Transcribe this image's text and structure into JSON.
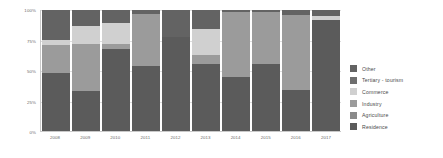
{
  "chart_data": {
    "type": "bar",
    "stacked": true,
    "stack_mode": "percent",
    "title": "",
    "subtitle": "",
    "xlabel": "",
    "ylabel": "",
    "ylim": [
      0,
      100
    ],
    "ytick_labels": [
      "0%",
      "25%",
      "50%",
      "75%",
      "100%"
    ],
    "ytick_values": [
      0,
      25,
      50,
      75,
      100
    ],
    "grid": true,
    "legend_position": "right",
    "categories": [
      "2008",
      "2009",
      "2010",
      "2011",
      "2012",
      "2013",
      "2014",
      "2015",
      "2016",
      "2017"
    ],
    "series": [
      {
        "name": "Residence",
        "color": "#5b5b5b",
        "values": [
          48,
          33,
          68,
          54,
          78,
          55,
          45,
          55,
          34,
          92
        ]
      },
      {
        "name": "Agriculture",
        "color": "#7f7f7f",
        "values": [
          0,
          0,
          0,
          0,
          0,
          0,
          0,
          0,
          0,
          0
        ]
      },
      {
        "name": "Industry",
        "color": "#9b9b9b",
        "values": [
          23,
          39,
          4,
          43,
          0,
          8,
          53,
          43,
          62,
          0
        ]
      },
      {
        "name": "Commerce",
        "color": "#d0d0d0",
        "values": [
          4,
          15,
          17,
          0,
          0,
          21,
          0,
          0,
          0,
          3
        ]
      },
      {
        "name": "Tertiary - tourism",
        "color": "#6e6e6e",
        "values": [
          0,
          0,
          0,
          0,
          0,
          0,
          0,
          0,
          0,
          0
        ]
      },
      {
        "name": "Other",
        "color": "#636363",
        "values": [
          25,
          13,
          11,
          3,
          22,
          16,
          2,
          2,
          4,
          5
        ]
      }
    ],
    "legend_entries": [
      {
        "label": "Other",
        "color": "#636363"
      },
      {
        "label": "Tertiary - tourism",
        "color": "#6e6e6e"
      },
      {
        "label": "Commerce",
        "color": "#d0d0d0"
      },
      {
        "label": "Industry",
        "color": "#9b9b9b"
      },
      {
        "label": "Agriculture",
        "color": "#8a8a8a"
      },
      {
        "label": "Residence",
        "color": "#5b5b5b"
      }
    ]
  }
}
